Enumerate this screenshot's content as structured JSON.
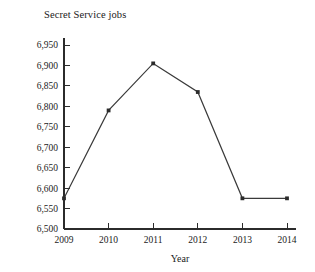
{
  "chart_data": {
    "type": "line",
    "title": "Secret Service jobs",
    "xlabel": "Year",
    "ylabel": "",
    "categories": [
      "2009",
      "2010",
      "2011",
      "2012",
      "2013",
      "2014"
    ],
    "x": [
      2009,
      2010,
      2011,
      2012,
      2013,
      2014
    ],
    "values": [
      6575,
      6790,
      6905,
      6835,
      6575,
      6575
    ],
    "series": [
      {
        "name": "Secret Service jobs",
        "values": [
          6575,
          6790,
          6905,
          6835,
          6575,
          6575
        ]
      }
    ],
    "ylim": [
      6500,
      6950
    ],
    "ytick_step": 50,
    "ytick_labels": [
      "6,500",
      "6,550",
      "6,600",
      "6,650",
      "6,700",
      "6,750",
      "6,800",
      "6,850",
      "6,900",
      "6,950"
    ],
    "ytick_values": [
      6500,
      6550,
      6600,
      6650,
      6700,
      6750,
      6800,
      6850,
      6900,
      6950
    ],
    "xtick_labels": [
      "2009",
      "2010",
      "2011",
      "2012",
      "2013",
      "2014"
    ],
    "grid": false,
    "legend": false,
    "legend_position": "none",
    "marker": "square",
    "line_color": "#3a3a3a",
    "marker_color": "#2b2b2b",
    "axis_color": "#2b2b2b",
    "background_color": "#ffffff"
  }
}
